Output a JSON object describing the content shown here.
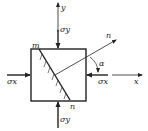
{
  "diagram": {
    "colors": {
      "stroke": "#222222",
      "background": "#ffffff"
    },
    "labels": {
      "y_axis": "y",
      "x_axis": "x",
      "sigma_y_top": "σy",
      "sigma_y_bottom": "σy",
      "sigma_x_left": "σx",
      "sigma_x_right": "σx",
      "section_start": "m",
      "section_end": "n",
      "normal": "n",
      "angle": "α"
    }
  }
}
